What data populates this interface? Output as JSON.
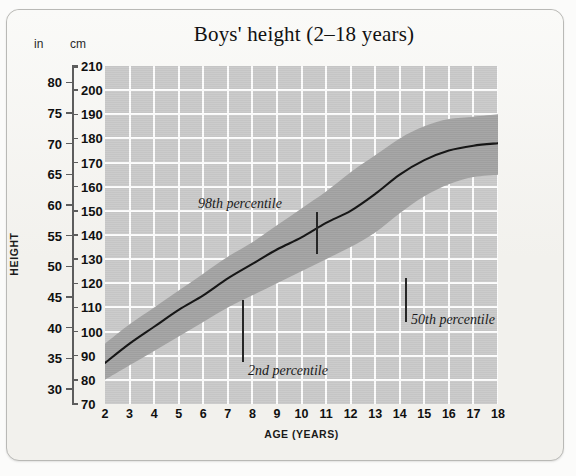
{
  "figure": {
    "title": "Boys' height (2–18 years)",
    "height_axis_label": "HEIGHT",
    "age_axis_label": "AGE (YEARS)",
    "unit_inches": "in",
    "unit_centimetres": "cm"
  },
  "colors": {
    "card_background": "#f2f1ed",
    "card_border": "#b9b9b6",
    "plot_background": "#c9c9c9",
    "gridline": "#fdfdfd",
    "percentile_band": "#a2a2a2",
    "median_curve": "#111111",
    "text": "#101010"
  },
  "annotations": [
    {
      "label": "98th percentile"
    },
    {
      "label": "2nd percentile"
    },
    {
      "label": "50th percentile"
    }
  ],
  "chart_data": {
    "type": "line",
    "title": "Boys' height (2–18 years)",
    "xlabel": "AGE (YEARS)",
    "ylabel": "HEIGHT",
    "grid": true,
    "legend": "none",
    "xlim": [
      2,
      18
    ],
    "ylim_cm": [
      70,
      210
    ],
    "ylim_in": [
      27.6,
      82.7
    ],
    "x_tick_labels": [
      "2",
      "3",
      "4",
      "5",
      "6",
      "7",
      "8",
      "9",
      "10",
      "11",
      "12",
      "13",
      "14",
      "15",
      "16",
      "17",
      "18"
    ],
    "y_tick_labels_cm": [
      "210",
      "200",
      "190",
      "180",
      "170",
      "160",
      "150",
      "140",
      "130",
      "120",
      "110",
      "100",
      "90",
      "80",
      "70"
    ],
    "y_tick_labels_in": [
      "80",
      "75",
      "70",
      "65",
      "60",
      "55",
      "50",
      "45",
      "40",
      "35",
      "30"
    ],
    "y_ticks_cm": [
      210,
      200,
      190,
      180,
      170,
      160,
      150,
      140,
      130,
      120,
      110,
      100,
      90,
      80,
      70
    ],
    "y_ticks_in": [
      80,
      75,
      70,
      65,
      60,
      55,
      50,
      45,
      40,
      35,
      30
    ],
    "x": [
      2,
      3,
      4,
      5,
      6,
      7,
      8,
      9,
      10,
      11,
      12,
      13,
      14,
      15,
      16,
      17,
      18
    ],
    "series": [
      {
        "name": "98th percentile",
        "units": "cm",
        "values": [
          95,
          103,
          110,
          117,
          124,
          131,
          137,
          144,
          151,
          158,
          166,
          173,
          180,
          185,
          188,
          189,
          190
        ]
      },
      {
        "name": "50th percentile",
        "units": "cm",
        "values": [
          87,
          95,
          102,
          109,
          115,
          122,
          128,
          134,
          139,
          145,
          150,
          157,
          165,
          171,
          175,
          177,
          178
        ]
      },
      {
        "name": "2nd percentile",
        "units": "cm",
        "values": [
          80,
          86,
          92,
          98,
          104,
          110,
          115,
          120,
          125,
          130,
          135,
          141,
          149,
          156,
          161,
          164,
          165
        ]
      }
    ],
    "annotations": [
      {
        "text": "98th percentile",
        "points_to_series": "98th percentile",
        "points_to_x": 9.8
      },
      {
        "text": "2nd percentile",
        "points_to_series": "2nd percentile",
        "points_to_x": 7.0
      },
      {
        "text": "50th percentile",
        "points_to_series": "50th percentile",
        "points_to_x": 13.1
      }
    ]
  }
}
